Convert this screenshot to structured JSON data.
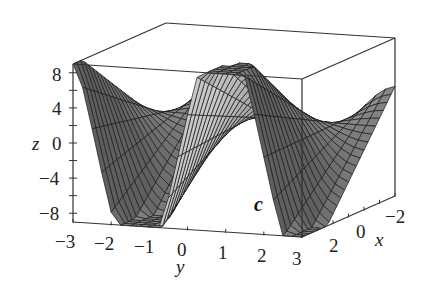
{
  "chart_data": {
    "type": "surface3d",
    "title": "",
    "panel_label": "c",
    "function_description": "Wave surface z(x,y): sinusoidal in y with amplitude proportional to x (twisting sheet), peaks ~ +9, troughs ~ -9",
    "x": {
      "label": "x",
      "range": [
        -3,
        3
      ],
      "ticks": [
        2,
        0,
        -2
      ]
    },
    "y": {
      "label": "y",
      "range": [
        -3,
        3
      ],
      "ticks": [
        -3,
        -2,
        -1,
        0,
        1,
        2,
        3
      ]
    },
    "z": {
      "label": "z",
      "range": [
        -9,
        9
      ],
      "ticks": [
        8,
        4,
        0,
        -4,
        -8
      ]
    },
    "grid": false,
    "box": true,
    "mesh_resolution": 24,
    "colors": {
      "surface": "#8a8a8a",
      "mesh": "#1a1a1a",
      "box": "#333333",
      "background": "#ffffff"
    }
  },
  "axes": {
    "z_label": "z",
    "y_label": "y",
    "x_label": "x",
    "z_ticks": [
      "8",
      "4",
      "0",
      "−4",
      "−8"
    ],
    "y_ticks": [
      "−3",
      "−2",
      "−1",
      "0",
      "1",
      "2",
      "3"
    ],
    "x_ticks": [
      "2",
      "0",
      "−2"
    ]
  },
  "panel_label": "c"
}
